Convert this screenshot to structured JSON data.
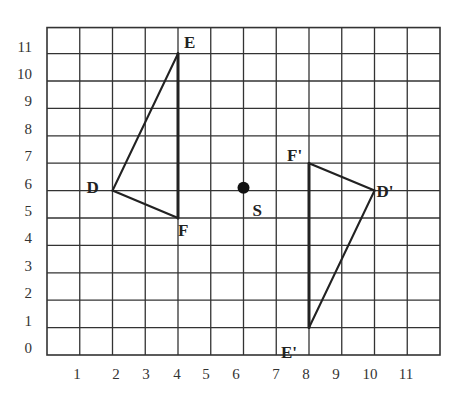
{
  "diagram": {
    "type": "coordinate-grid",
    "grid": {
      "x_min": 0,
      "x_max": 12,
      "y_min": 0,
      "y_max": 11.95,
      "pixel_origin": [
        47,
        355
      ],
      "unit_x_px": 32.75,
      "unit_y_px": 27.4,
      "line_color": "#333333"
    },
    "x_axis_labels": [
      {
        "text": "1",
        "px": 77
      },
      {
        "text": "2",
        "px": 116
      },
      {
        "text": "3",
        "px": 146
      },
      {
        "text": "4",
        "px": 177
      },
      {
        "text": "5",
        "px": 206
      },
      {
        "text": "6",
        "px": 236
      },
      {
        "text": "7",
        "px": 276
      },
      {
        "text": "8",
        "px": 306
      },
      {
        "text": "9",
        "px": 336
      },
      {
        "text": "10",
        "px": 370
      },
      {
        "text": "11",
        "px": 406
      }
    ],
    "y_axis_labels": [
      {
        "text": "0",
        "value": 0
      },
      {
        "text": "1",
        "value": 1
      },
      {
        "text": "2",
        "value": 2
      },
      {
        "text": "3",
        "value": 3
      },
      {
        "text": "4",
        "value": 4
      },
      {
        "text": "5",
        "value": 5
      },
      {
        "text": "6",
        "value": 6
      },
      {
        "text": "7",
        "value": 7
      },
      {
        "text": "8",
        "value": 8
      },
      {
        "text": "9",
        "value": 9
      },
      {
        "text": "10",
        "value": 10
      },
      {
        "text": "11",
        "value": 11
      }
    ],
    "triangles": [
      {
        "name": "DEF",
        "vertices": [
          {
            "label": "D",
            "x": 2,
            "y": 6,
            "label_dx": -26,
            "label_dy": 2
          },
          {
            "label": "E",
            "x": 4,
            "y": 11,
            "label_dx": 6,
            "label_dy": -6
          },
          {
            "label": "F",
            "x": 4,
            "y": 5,
            "label_dx": 0,
            "label_dy": 18
          }
        ]
      },
      {
        "name": "D'E'F'",
        "vertices": [
          {
            "label": "D'",
            "x": 10,
            "y": 6,
            "label_dx": 2,
            "label_dy": 6
          },
          {
            "label": "E'",
            "x": 8,
            "y": 1,
            "label_dx": -28,
            "label_dy": 30
          },
          {
            "label": "F'",
            "x": 8,
            "y": 7,
            "label_dx": -22,
            "label_dy": -2
          }
        ]
      }
    ],
    "center_point": {
      "label": "S",
      "x": 6,
      "y": 6.1,
      "label_dx": 9,
      "label_dy": 28
    }
  }
}
